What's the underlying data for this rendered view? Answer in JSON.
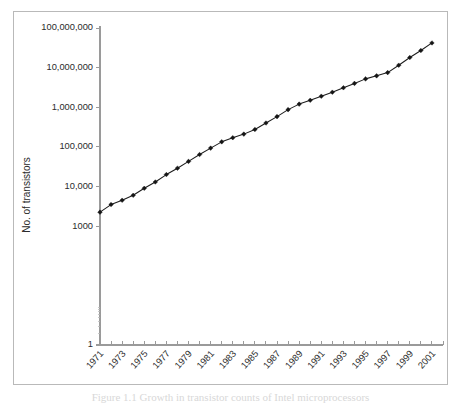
{
  "figure": {
    "title": "",
    "caption_partial": "Figure 1.1   Growth in transistor counts of Intel microprocessors"
  },
  "chart_data": {
    "type": "line",
    "title": "",
    "subtitle": "",
    "xlabel": "",
    "ylabel": "No. of transistors",
    "yscale": "log",
    "xscale": "linear",
    "grid": false,
    "legend": null,
    "ylim": [
      1,
      100000000
    ],
    "xlim": [
      1971,
      2002
    ],
    "ytick_labels": [
      "100,000,000",
      "10,000,000",
      "1,000,000",
      "100,000",
      "10,000",
      "1000",
      "1"
    ],
    "ytick_values": [
      100000000,
      10000000,
      1000000,
      100000,
      10000,
      1000,
      1
    ],
    "xtick_labels": [
      "1971",
      "1973",
      "1975",
      "1977",
      "1979",
      "1981",
      "1983",
      "1985",
      "1987",
      "1989",
      "1991",
      "1993",
      "1995",
      "1997",
      "1999",
      "2001"
    ],
    "xtick_values": [
      1971,
      1973,
      1975,
      1977,
      1979,
      1981,
      1983,
      1985,
      1987,
      1989,
      1991,
      1993,
      1995,
      1997,
      1999,
      2001
    ],
    "marker": "diamond",
    "line_color": "#1c1c1c",
    "marker_color": "#151515",
    "series": [
      {
        "name": "No. of transistors",
        "x": [
          1971,
          1972,
          1973,
          1974,
          1975,
          1976,
          1977,
          1978,
          1979,
          1980,
          1981,
          1982,
          1983,
          1984,
          1985,
          1986,
          1987,
          1988,
          1989,
          1990,
          1991,
          1992,
          1993,
          1994,
          1995,
          1996,
          1997,
          1998,
          1999,
          2000,
          2001
        ],
        "values": [
          2250,
          3500,
          4500,
          6000,
          9000,
          13000,
          20000,
          29000,
          43000,
          64000,
          93000,
          134000,
          170000,
          210000,
          275000,
          400000,
          580000,
          870000,
          1200000,
          1500000,
          1900000,
          2400000,
          3100000,
          4000000,
          5200000,
          6200000,
          7500000,
          11500000,
          18000000,
          27000000,
          42000000
        ]
      }
    ]
  }
}
